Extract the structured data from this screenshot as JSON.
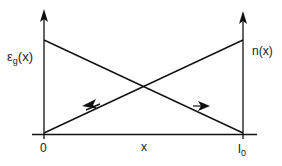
{
  "diagram": {
    "left_axis_label": {
      "main": "ε",
      "sub": "g",
      "arg": "(x)"
    },
    "right_axis_label": "n(x)",
    "x_axis_label": "x",
    "origin_label": "0",
    "end_label": {
      "main": "l",
      "sub": "0"
    },
    "lines": [
      {
        "name": "epsilon-g-line",
        "from": [
          0,
          "high"
        ],
        "to": [
          "l0",
          "low"
        ],
        "direction": "decreasing"
      },
      {
        "name": "n-line",
        "from": [
          0,
          "low"
        ],
        "to": [
          "l0",
          "high"
        ],
        "direction": "increasing"
      }
    ],
    "arrows": [
      {
        "on": "n-line",
        "points": "left"
      },
      {
        "on": "epsilon-g-line",
        "points": "right"
      }
    ],
    "colors": {
      "stroke": "#111111",
      "background": "#ffffff"
    }
  }
}
